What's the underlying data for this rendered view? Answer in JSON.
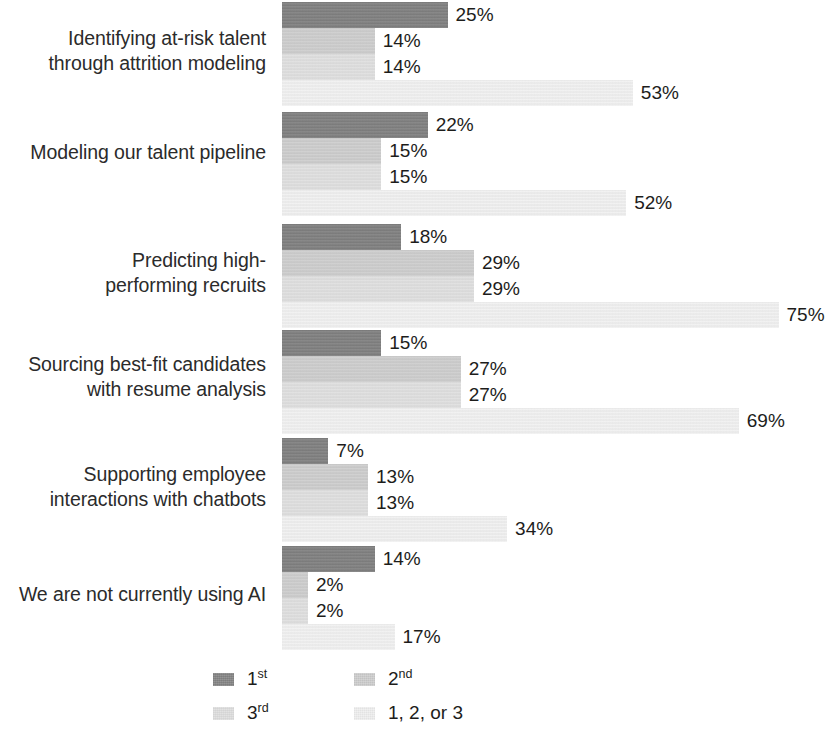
{
  "chart_data": {
    "type": "bar",
    "orientation": "horizontal",
    "title": "",
    "subtitle": "",
    "xlabel": "",
    "ylabel": "",
    "grid": false,
    "legend_position": "bottom",
    "value_suffix": "%",
    "axis_max": 80,
    "categories": [
      "Identifying at-risk talent\nthrough attrition modeling",
      "Modeling our talent pipeline",
      "Predicting high-\nperforming recruits",
      "Sourcing best-fit candidates\nwith resume analysis",
      "Supporting employee\ninteractions with chatbots",
      "We are not currently using AI"
    ],
    "series": [
      {
        "name": "1st",
        "color": "#7d7d7d",
        "values": [
          25,
          22,
          18,
          15,
          7,
          14
        ],
        "labels": [
          "25%",
          "22%",
          "18%",
          "15%",
          "7%",
          "14%"
        ]
      },
      {
        "name": "2nd",
        "color": "#cfcfcf",
        "values": [
          14,
          15,
          29,
          27,
          13,
          2
        ],
        "labels": [
          "14%",
          "15%",
          "29%",
          "27%",
          "13%",
          "2%"
        ]
      },
      {
        "name": "3rd",
        "color": "#e2e2e2",
        "values": [
          14,
          15,
          29,
          27,
          13,
          2
        ],
        "labels": [
          "14%",
          "15%",
          "29%",
          "27%",
          "13%",
          "2%"
        ]
      },
      {
        "name": "1, 2, or 3",
        "color": "#f4f4f4",
        "values": [
          53,
          52,
          75,
          69,
          34,
          17
        ],
        "labels": [
          "53%",
          "52%",
          "75%",
          "69%",
          "34%",
          "17%"
        ]
      }
    ]
  },
  "legend": {
    "items": [
      {
        "label": "1st",
        "base": "1",
        "ordinal": "st",
        "color": "#7d7d7d"
      },
      {
        "label": "2nd",
        "base": "2",
        "ordinal": "nd",
        "color": "#cfcfcf"
      },
      {
        "label": "3rd",
        "base": "3",
        "ordinal": "rd",
        "color": "#e2e2e2"
      },
      {
        "label": "1, 2, or 3",
        "base": "1, 2, or 3",
        "ordinal": "",
        "color": "#f4f4f4"
      }
    ]
  }
}
